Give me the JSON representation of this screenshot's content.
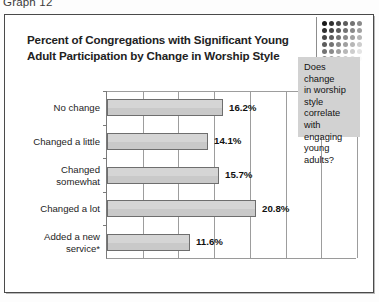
{
  "caption": "Graph 12",
  "title": {
    "line1": "Percent of Congregations with Significant Young",
    "line2": "Adult Participation by Change in Worship Style"
  },
  "callout": {
    "line1": "Does change",
    "line2": "in worship",
    "line3": "style correlate",
    "line4": "with engaging",
    "line5": "young adults?"
  },
  "colors": {
    "bar_fill": "#c9c9c9",
    "bar_border": "#6e6e6e",
    "gridline": "#9d9d9d",
    "callout_fill": "#d2d2d2",
    "frame": "#4a4a4a"
  },
  "chart_data": {
    "type": "bar",
    "orientation": "horizontal",
    "title": "Percent of Congregations with Significant Young Adult Participation by Change in Worship Style",
    "xlabel": "",
    "ylabel": "",
    "categories": [
      "No change",
      "Changed a little",
      "Changed somewhat",
      "Changed a lot",
      "Added a new service*"
    ],
    "values": [
      16.2,
      14.1,
      15.7,
      20.8,
      11.6
    ],
    "value_labels": [
      "16.2%",
      "14.1%",
      "15.7%",
      "20.8%",
      "11.6%"
    ],
    "xlim": [
      0,
      35
    ],
    "gridlines": 7,
    "tick_labels_visible": false,
    "grid": true,
    "legend": "none"
  }
}
